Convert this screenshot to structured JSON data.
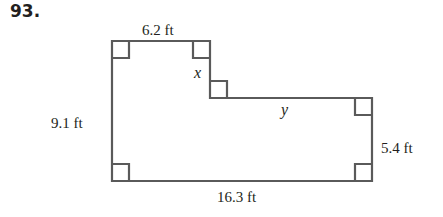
{
  "problem_number": "93.",
  "figure": {
    "type": "L-shaped polygon with right-angle markers",
    "labels": {
      "top": "6.2 ft",
      "left": "9.1 ft",
      "right": "5.4 ft",
      "bottom": "16.3 ft",
      "step_vertical": "x",
      "step_horizontal": "y"
    },
    "stroke_color": "#5a5a5a",
    "right_angle_markers": 7
  }
}
